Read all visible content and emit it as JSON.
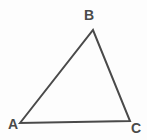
{
  "figure": {
    "type": "triangle-diagram",
    "background_color": "#fdfdfd",
    "stroke_color": "#4a4a4a",
    "label_color": "#4a4a4a",
    "stroke_width": 2,
    "width": 147,
    "height": 140
  },
  "labels": {
    "a": "A",
    "b": "B",
    "c": "C"
  },
  "geometry": {
    "vertices": [
      {
        "name": "A",
        "x": 20,
        "y": 123
      },
      {
        "name": "B",
        "x": 93,
        "y": 30
      },
      {
        "name": "C",
        "x": 130,
        "y": 121
      }
    ],
    "edges": [
      {
        "name": "AB",
        "from": "A",
        "to": "B"
      },
      {
        "name": "BC",
        "from": "B",
        "to": "C"
      },
      {
        "name": "AC",
        "from": "A",
        "to": "C"
      }
    ],
    "polygon_points": "20,123 93,30 130,121"
  }
}
